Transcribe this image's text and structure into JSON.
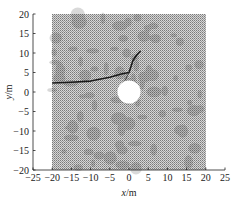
{
  "chart_data": {
    "type": "scatter",
    "title": "",
    "xlabel": "x/m",
    "ylabel": "y/m",
    "xlim": [
      -25,
      25
    ],
    "ylim": [
      -20,
      20
    ],
    "x_ticks": [
      "-25",
      "-20",
      "-15",
      "-10",
      "-5",
      "0",
      "5",
      "10",
      "15",
      "20",
      "25"
    ],
    "y_ticks": [
      "20",
      "15",
      "10",
      "5",
      "0",
      "-5",
      "-10",
      "-15",
      "-20"
    ],
    "grid": false,
    "legend": null,
    "mesh_region": {
      "x": [
        -20,
        20
      ],
      "y": [
        -20,
        20
      ],
      "description": "dense particle/mesh domain"
    },
    "hole": {
      "center": [
        0,
        0
      ],
      "radius": 3
    },
    "fracture_path": {
      "x": [
        -20,
        -15,
        -10,
        -5,
        -2,
        0,
        0.5,
        1,
        2,
        3
      ],
      "y": [
        2.3,
        2.5,
        2.8,
        3.8,
        4.6,
        5,
        6.5,
        8,
        9.5,
        10.5
      ]
    },
    "fracture_branch": {
      "x": [
        0,
        -1
      ],
      "y": [
        5,
        3
      ]
    }
  }
}
